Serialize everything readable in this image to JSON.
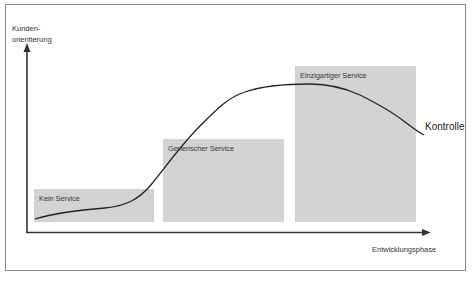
{
  "diagram": {
    "y_axis": {
      "label_line1": "Kunden-",
      "label_line2": "orientierung"
    },
    "x_axis": {
      "label": "Entwicklungsphase"
    },
    "stages": [
      {
        "label": "Kein Service"
      },
      {
        "label": "Generischer Service"
      },
      {
        "label": "Einzigartiger Service"
      }
    ],
    "curve": {
      "label": "Kontrolle"
    },
    "colors": {
      "box_fill": "#d3d3d3",
      "line": "#222222",
      "frame": "#8a8a8a"
    }
  }
}
